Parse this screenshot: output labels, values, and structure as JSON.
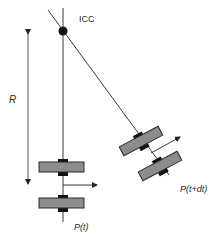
{
  "diagram": {
    "type": "differential-drive-kinematics",
    "labels": {
      "icc": "ICC",
      "radius": "R",
      "pose_t": "P(t)",
      "pose_t_dt": "P(t+dt)"
    },
    "elements": {
      "icc_point": {
        "x": 63,
        "y": 31
      },
      "radius_arrow": {
        "x": 28,
        "y1": 32,
        "y2": 186
      },
      "robot_at_t": {
        "center_x": 63,
        "wheel_y": [
          167,
          203
        ],
        "heading": "right"
      },
      "robot_at_t_dt": {
        "wheel_centers": [
          [
            141,
            141
          ],
          [
            160,
            165
          ]
        ],
        "rotation_deg": -28,
        "heading": "up-right"
      }
    },
    "colors": {
      "line": "#3a3a3a",
      "wheel_fill": "#8c8c8c",
      "wheel_stroke": "#2a2a2a",
      "axle": "#111111",
      "icc_dot": "#111111"
    }
  }
}
